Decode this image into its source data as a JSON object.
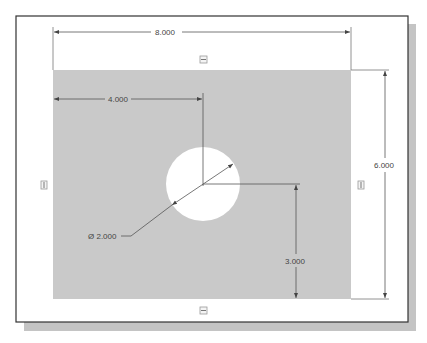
{
  "drawing": {
    "colors": {
      "background": "#ffffff",
      "frame_border": "#333333",
      "frame_shadow": "#c4c4c4",
      "plate_fill": "#c9c9c9",
      "hole_fill": "#ffffff",
      "dimension_line": "#555555",
      "text": "#444444"
    },
    "plate": {
      "width": "8.000",
      "height": "6.000"
    },
    "hole": {
      "diameter_label": "Ø 2.000"
    },
    "dimensions": {
      "overall_width": "8.000",
      "overall_height": "6.000",
      "hole_x_offset": "4.000",
      "hole_y_offset": "3.000",
      "hole_diameter": "Ø 2.000"
    },
    "handles": [
      {
        "position": "top",
        "icon": "resize-handle-icon"
      },
      {
        "position": "bottom",
        "icon": "resize-handle-icon"
      },
      {
        "position": "left",
        "icon": "resize-handle-icon"
      },
      {
        "position": "right",
        "icon": "resize-handle-icon"
      }
    ]
  }
}
